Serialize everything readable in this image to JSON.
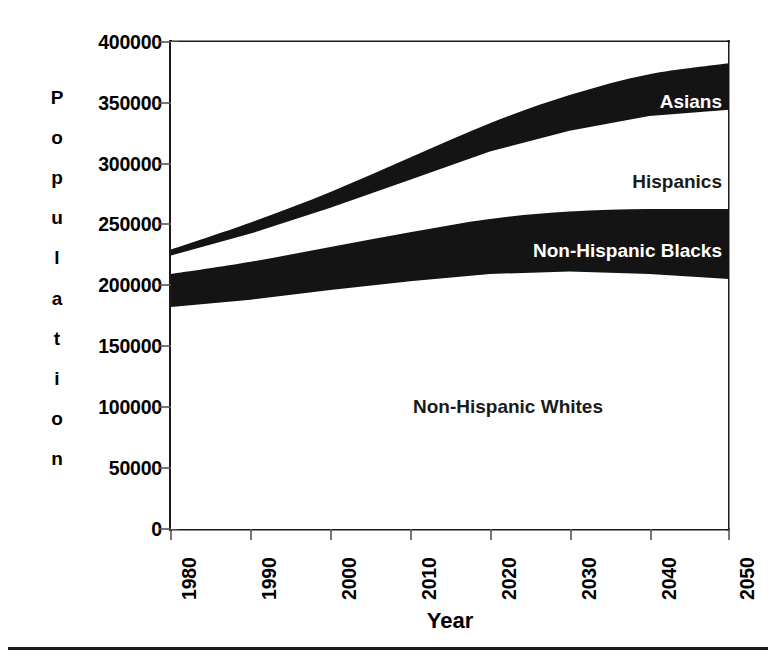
{
  "figure": {
    "title": "",
    "axis_color": "#1a1a1a",
    "band_color": "#141414",
    "background": "#ffffff"
  },
  "yaxis": {
    "label_letters": [
      "P",
      "o",
      "p",
      "u",
      "l",
      "a",
      "t",
      "i",
      "o",
      "n"
    ],
    "label_text": "Population",
    "ticks": [
      "400000",
      "350000",
      "300000",
      "250000",
      "200000",
      "150000",
      "100000",
      "50000",
      "0"
    ],
    "tick_values": [
      400000,
      350000,
      300000,
      250000,
      200000,
      150000,
      100000,
      50000,
      0
    ]
  },
  "xaxis": {
    "label_text": "Year",
    "ticks": [
      "1980",
      "1990",
      "2000",
      "2010",
      "2020",
      "2030",
      "2040",
      "2050"
    ],
    "tick_values": [
      1980,
      1990,
      2000,
      2010,
      2020,
      2030,
      2040,
      2050
    ]
  },
  "series_labels": {
    "asians": "Asians",
    "hispanics": "Hispanics",
    "blacks": "Non-Hispanic Blacks",
    "whites": "Non-Hispanic Whites"
  },
  "chart_data": {
    "type": "area",
    "title": "",
    "subtitle": "",
    "xlabel": "Year",
    "ylabel": "Population",
    "xlim": [
      1980,
      2050
    ],
    "ylim": [
      0,
      400000
    ],
    "ytick_interval": 50000,
    "grid": false,
    "legend": "inline-labels",
    "stacked": true,
    "units": "thousands of persons",
    "x": [
      1980,
      1990,
      2000,
      2010,
      2020,
      2030,
      2040,
      2050
    ],
    "series": [
      {
        "name": "Non-Hispanic Whites",
        "fill": "#ffffff",
        "label_position": "inside-band",
        "values": [
          182000,
          188000,
          196000,
          203000,
          209000,
          211000,
          209000,
          205000
        ]
      },
      {
        "name": "Non-Hispanic Blacks",
        "fill": "#141414",
        "label_position": "inside-band",
        "values": [
          27000,
          31000,
          35000,
          40000,
          45000,
          49000,
          53000,
          57000
        ]
      },
      {
        "name": "Hispanics",
        "fill": "#ffffff",
        "label_position": "inside-band",
        "values": [
          15000,
          23000,
          32000,
          43000,
          55000,
          66000,
          76000,
          81000
        ]
      },
      {
        "name": "Asians",
        "fill": "#141414",
        "label_position": "inside-band",
        "values": [
          5000,
          9000,
          13000,
          18000,
          23000,
          29000,
          34000,
          38000
        ]
      }
    ],
    "cumulative": [
      {
        "name": "Non-Hispanic Whites (top edge)",
        "values": [
          182000,
          188000,
          196000,
          203000,
          209000,
          211000,
          209000,
          205000
        ]
      },
      {
        "name": "+ Non-Hispanic Blacks (top edge)",
        "values": [
          209000,
          219000,
          231000,
          243000,
          254000,
          260000,
          262000,
          262000
        ]
      },
      {
        "name": "+ Hispanics (top edge)",
        "values": [
          224000,
          242000,
          263000,
          286000,
          309000,
          326000,
          338000,
          343000
        ]
      },
      {
        "name": "+ Asians = Total (top edge)",
        "values": [
          229000,
          251000,
          276000,
          304000,
          332000,
          355000,
          372000,
          381000
        ]
      }
    ]
  }
}
